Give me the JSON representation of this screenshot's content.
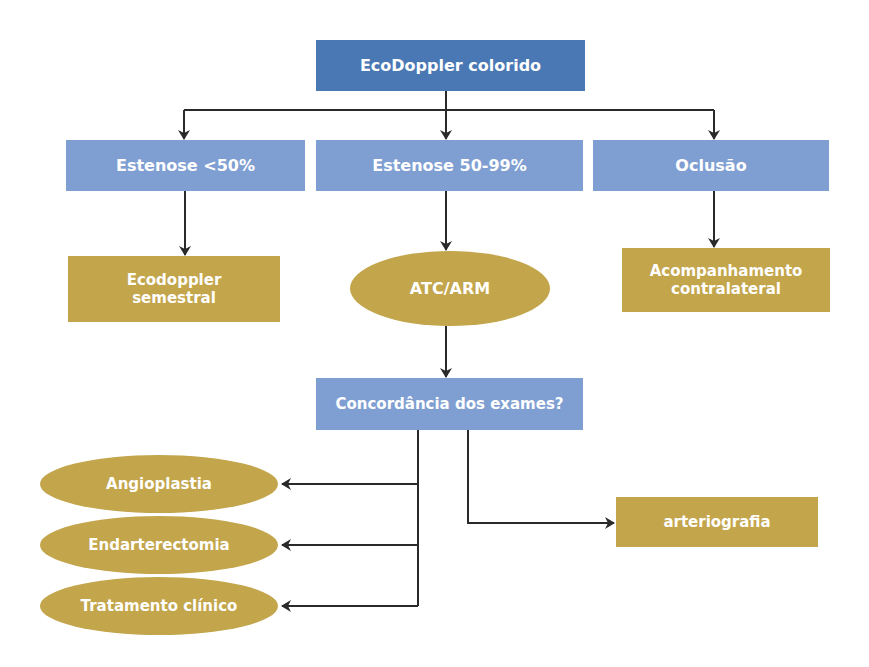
{
  "colors": {
    "root": "#4a78b4",
    "category": "#7f9fd2",
    "outcome": "#c3a54b",
    "arrow": "#2a2a2a",
    "text": "#ffffff"
  },
  "nodes": {
    "root": {
      "label": "EcoDoppler colorido",
      "shape": "rectangle"
    },
    "stenosis_lt50": {
      "label": "Estenose <50%",
      "shape": "rectangle"
    },
    "stenosis_50_99": {
      "label": "Estenose 50-99%",
      "shape": "rectangle"
    },
    "occlusion": {
      "label": "Oclusão",
      "shape": "rectangle"
    },
    "ecodoppler_semestral": {
      "label": "Ecodoppler semestral",
      "shape": "rectangle"
    },
    "atc_arm": {
      "label": "ATC/ARM",
      "shape": "ellipse"
    },
    "acompanhamento": {
      "label": "Acompanhamento contralateral",
      "shape": "rectangle"
    },
    "concordancia": {
      "label": "Concordância dos exames?",
      "shape": "rectangle"
    },
    "angioplastia": {
      "label": "Angioplastia",
      "shape": "ellipse"
    },
    "endarterectomia": {
      "label": "Endarterectomia",
      "shape": "ellipse"
    },
    "tratamento": {
      "label": "Tratamento clínico",
      "shape": "ellipse"
    },
    "arteriografia": {
      "label": "arteriografia",
      "shape": "rectangle"
    }
  },
  "edges": [
    {
      "from": "root",
      "to": "stenosis_lt50"
    },
    {
      "from": "root",
      "to": "stenosis_50_99"
    },
    {
      "from": "root",
      "to": "occlusion"
    },
    {
      "from": "stenosis_lt50",
      "to": "ecodoppler_semestral"
    },
    {
      "from": "stenosis_50_99",
      "to": "atc_arm"
    },
    {
      "from": "occlusion",
      "to": "acompanhamento"
    },
    {
      "from": "atc_arm",
      "to": "concordancia"
    },
    {
      "from": "concordancia",
      "to": "angioplastia"
    },
    {
      "from": "concordancia",
      "to": "endarterectomia"
    },
    {
      "from": "concordancia",
      "to": "tratamento"
    },
    {
      "from": "concordancia",
      "to": "arteriografia"
    }
  ]
}
